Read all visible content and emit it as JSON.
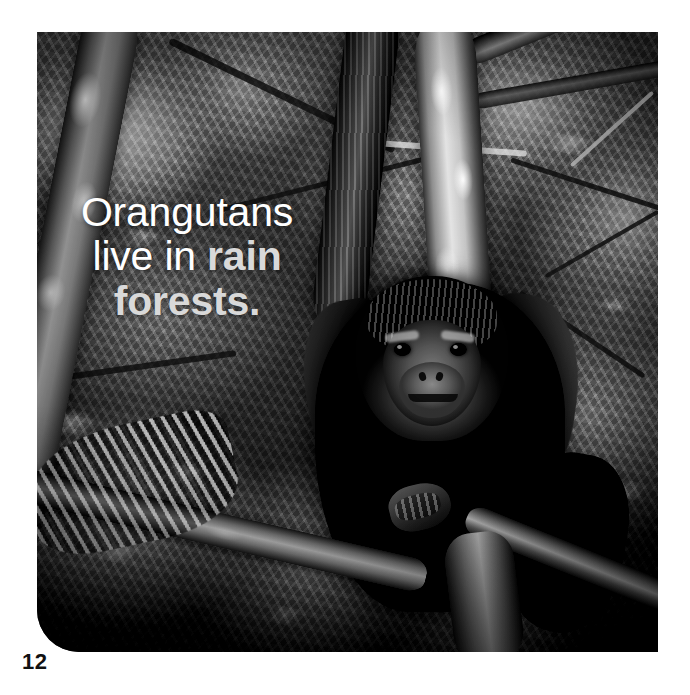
{
  "page": {
    "background_color": "#ffffff",
    "page_number": "12"
  },
  "photo": {
    "alt_description": "Black and white photograph of a young orangutan sitting on a branch in a dense rain forest canopy",
    "treatment": "black-and-white",
    "corner_style": "rounded-bottom-left"
  },
  "caption": {
    "line1": "Orangutans",
    "line2_part1": "live in ",
    "line2_part2": "rain",
    "line3": "forests.",
    "full_text": "Orangutans live in rain forests.",
    "highlight_terms": "rain forests",
    "plain_color": "#ffffff",
    "highlight_color": "#d9d9d9"
  }
}
